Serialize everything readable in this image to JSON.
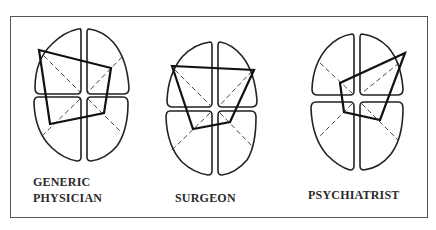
{
  "figure": {
    "panels": [
      {
        "id": "generic",
        "label_lines": [
          "GENERIC",
          "PHYSICIAN"
        ],
        "polygon": [
          [
            39,
            50
          ],
          [
            111,
            68
          ],
          [
            104,
            113
          ],
          [
            50,
            124
          ]
        ]
      },
      {
        "id": "surgeon",
        "label_lines": [
          "SURGEON"
        ],
        "polygon": [
          [
            172,
            66
          ],
          [
            254,
            70
          ],
          [
            230,
            122
          ],
          [
            193,
            129
          ]
        ]
      },
      {
        "id": "psychiatrist",
        "label_lines": [
          "PSYCHIATRIST"
        ],
        "polygon": [
          [
            405,
            53
          ],
          [
            340,
            83
          ],
          [
            344,
            112
          ],
          [
            380,
            120
          ]
        ]
      }
    ]
  },
  "labels": {
    "generic_line1": "GENERIC",
    "generic_line2": "PHYSICIAN",
    "surgeon": "SURGEON",
    "psychiatrist": "PSYCHIATRIST"
  }
}
